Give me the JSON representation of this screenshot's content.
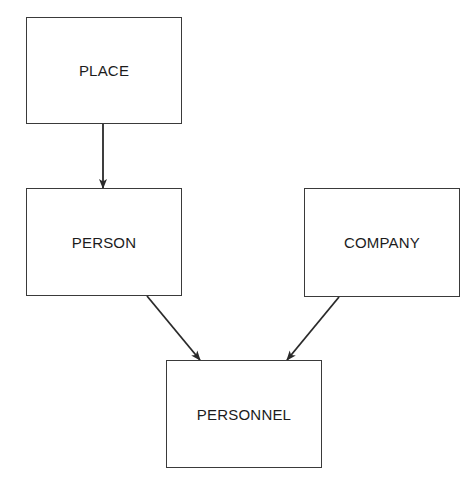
{
  "diagram": {
    "type": "entity-relationship",
    "nodes": [
      {
        "id": "place",
        "label": "PLACE",
        "x": 26,
        "y": 17,
        "w": 156,
        "h": 107
      },
      {
        "id": "person",
        "label": "PERSON",
        "x": 26,
        "y": 188,
        "w": 156,
        "h": 108
      },
      {
        "id": "company",
        "label": "COMPANY",
        "x": 304,
        "y": 188,
        "w": 156,
        "h": 109
      },
      {
        "id": "personnel",
        "label": "PERSONNEL",
        "x": 166,
        "y": 360,
        "w": 156,
        "h": 108
      }
    ],
    "edges": [
      {
        "from": "place",
        "to": "person",
        "x1": 103,
        "y1": 124,
        "x2": 103,
        "y2": 188
      },
      {
        "from": "person",
        "to": "personnel",
        "x1": 147,
        "y1": 296,
        "x2": 200,
        "y2": 360
      },
      {
        "from": "company",
        "to": "personnel",
        "x1": 339,
        "y1": 297,
        "x2": 287,
        "y2": 360
      }
    ],
    "colors": {
      "line": "#2a2a2a",
      "background": "#ffffff"
    }
  }
}
